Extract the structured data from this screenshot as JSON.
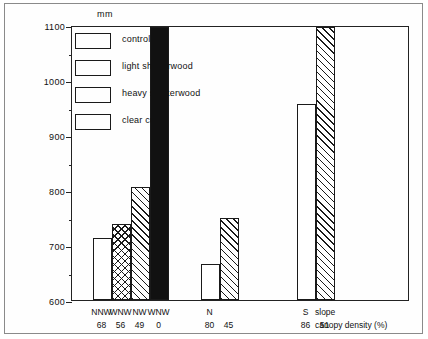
{
  "chart_data": {
    "type": "bar",
    "title": "",
    "xlabel": "",
    "ylabel": "mm",
    "unit_label": "mm",
    "ylim": [
      600,
      1100
    ],
    "ytick_major": [
      1100,
      1000,
      900,
      800,
      700,
      600
    ],
    "ytick_minor": [
      1050,
      950,
      850,
      750,
      650
    ],
    "grid": false,
    "legend_position": "top-left",
    "legend": [
      "control",
      "light shelterwood",
      "heavy shelterwood",
      "clear cut"
    ],
    "series": [
      {
        "name": "control",
        "values": [
          713,
          665,
          957
        ]
      },
      {
        "name": "light shelterwood",
        "values": [
          738,
          null,
          null
        ]
      },
      {
        "name": "heavy shelterwood",
        "values": [
          805,
          750,
          1096
        ]
      },
      {
        "name": "clear cut",
        "values": [
          1096,
          null,
          null
        ]
      }
    ],
    "groups": [
      {
        "label": "NNW",
        "bars": [
          {
            "treatment": "control",
            "aspect": "NNW",
            "canopy_density": "68",
            "value": 713
          },
          {
            "treatment": "light shelterwood",
            "aspect": "WNW",
            "canopy_density": "56",
            "value": 738
          },
          {
            "treatment": "heavy shelterwood",
            "aspect": "NW",
            "canopy_density": "49",
            "value": 805
          },
          {
            "treatment": "clear cut",
            "aspect": "WNW",
            "canopy_density": "0",
            "value": 1096
          }
        ]
      },
      {
        "label": "N",
        "bars": [
          {
            "treatment": "control",
            "aspect": "N",
            "canopy_density": "80",
            "value": 665
          },
          {
            "treatment": "heavy shelterwood",
            "aspect": "",
            "canopy_density": "45",
            "value": 750
          }
        ]
      },
      {
        "label": "S",
        "bars": [
          {
            "treatment": "control",
            "aspect": "S",
            "canopy_density": "86",
            "value": 957
          },
          {
            "treatment": "heavy shelterwood",
            "aspect": "",
            "canopy_density": "51",
            "value": 1096
          }
        ]
      }
    ],
    "aspect_row": [
      "NNW",
      "WNW",
      "NW",
      "WNW",
      "N",
      "",
      "S",
      ""
    ],
    "density_row": [
      "68",
      "56",
      "49",
      "0",
      "80",
      "45",
      "86",
      "51"
    ],
    "row_labels": {
      "slope": "slope",
      "canopy": "canopy density (%)"
    }
  }
}
